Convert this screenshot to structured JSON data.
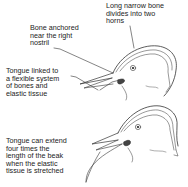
{
  "diagram": {
    "labels": {
      "top_right": "Long narrow bone\ndivides into two\nhorns",
      "top_left": "Bone anchored\nnear the right\nnostril",
      "middle_left": "Tongue linked to\na flexible system\nof bones and\nelastic tissue",
      "bottom_left": "Tongue can extend\nfour times the\nlength of the beak\nwhen the elastic\ntissue is stretched"
    },
    "figures": [
      {
        "name": "bird-head-tongue-retracted"
      },
      {
        "name": "bird-head-tongue-extended"
      }
    ],
    "colors": {
      "ink": "#333333",
      "background": "#ffffff"
    }
  }
}
